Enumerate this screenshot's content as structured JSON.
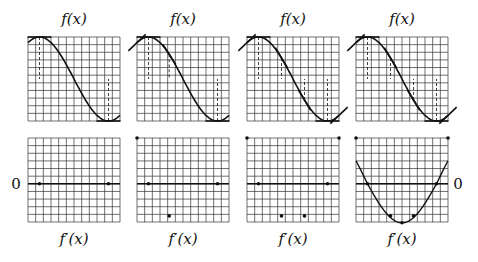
{
  "figure": {
    "top_label": "f(x)",
    "bottom_label": "f′(x)",
    "zero_left": "0",
    "zero_right": "0",
    "colors": {
      "ink": "#111111",
      "grid": "#333333",
      "background": "#ffffff"
    }
  },
  "layout": {
    "panel_x": [
      28,
      137,
      247,
      356
    ],
    "grid_width": 92,
    "grid_height": 84,
    "top_grid_y": 37,
    "bottom_grid_y": 138,
    "cols": 12,
    "rows": 11,
    "top_label_y": 24,
    "bottom_label_y": 244
  },
  "panels": [
    {
      "name": "panel-1",
      "tangent_points": [
        0.125,
        0.875
      ],
      "derivative_points": [
        [
          0.125,
          0
        ],
        [
          0.875,
          0
        ]
      ],
      "show_derivative_curve": false
    },
    {
      "name": "panel-2",
      "tangent_points": [
        0.0,
        0.125,
        0.35,
        0.875
      ],
      "derivative_points": [
        [
          0.0,
          1
        ],
        [
          0.125,
          0
        ],
        [
          0.35,
          -0.7
        ],
        [
          0.875,
          0
        ]
      ],
      "show_derivative_curve": false
    },
    {
      "name": "panel-3",
      "tangent_points": [
        0.0,
        0.125,
        0.375,
        0.625,
        0.875,
        1.0
      ],
      "derivative_points": [
        [
          0.0,
          1
        ],
        [
          0.125,
          0
        ],
        [
          0.375,
          -0.7
        ],
        [
          0.625,
          -0.7
        ],
        [
          0.875,
          0
        ],
        [
          1.0,
          1
        ]
      ],
      "show_derivative_curve": false
    },
    {
      "name": "panel-4",
      "tangent_points": [
        0.0,
        0.125,
        0.375,
        0.625,
        0.875,
        1.0
      ],
      "derivative_points": [
        [
          0.0,
          1
        ],
        [
          0.125,
          0
        ],
        [
          0.375,
          -0.7
        ],
        [
          0.5,
          -0.85
        ],
        [
          0.625,
          -0.7
        ],
        [
          0.875,
          0
        ],
        [
          1.0,
          1
        ]
      ],
      "show_derivative_curve": true
    }
  ]
}
